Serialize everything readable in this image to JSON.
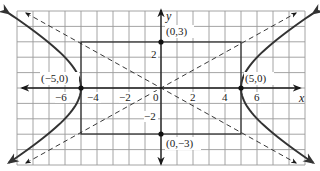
{
  "chart_data": {
    "type": "line",
    "title": "",
    "xlabel": "x",
    "ylabel": "y",
    "xlim": [
      -9,
      9
    ],
    "ylim": [
      -5,
      5
    ],
    "grid": true,
    "x_ticks": [
      -6,
      -4,
      -2,
      0,
      2,
      4,
      6
    ],
    "y_ticks": [
      -2,
      2
    ],
    "x_tick_labels": [
      "−6",
      "−4",
      "−2",
      "0",
      "2",
      "4",
      "6"
    ],
    "y_tick_labels": [
      "−2",
      "2"
    ],
    "series": [
      {
        "name": "hyperbola-right-branch",
        "style": "solid",
        "equation": "x^2/25 - y^2/9 = 1, x>0"
      },
      {
        "name": "hyperbola-left-branch",
        "style": "solid",
        "equation": "x^2/25 - y^2/9 = 1, x<0"
      },
      {
        "name": "asymptote-positive",
        "style": "dashed",
        "equation": "y = 3x/5"
      },
      {
        "name": "asymptote-negative",
        "style": "dashed",
        "equation": "y = -3x/5"
      },
      {
        "name": "central-rectangle",
        "style": "solid",
        "corners": [
          [
            -5,
            -3
          ],
          [
            5,
            -3
          ],
          [
            5,
            3
          ],
          [
            -5,
            3
          ]
        ]
      }
    ],
    "points": [
      {
        "label": "(−5,0)",
        "x": -5,
        "y": 0
      },
      {
        "label": "(5,0)",
        "x": 5,
        "y": 0
      },
      {
        "label": "(0,3)",
        "x": 0,
        "y": 3
      },
      {
        "label": "(0,−3)",
        "x": 0,
        "y": -3
      }
    ],
    "annotations": [
      "(−5,0)",
      "(5,0)",
      "(0,3)",
      "(0,−3)"
    ]
  },
  "labels": {
    "x_axis": "x",
    "y_axis": "y",
    "vertex_left": "(−5,0)",
    "vertex_right": "(5,0)",
    "covertex_top": "(0,3)",
    "covertex_bottom": "(0,−3)",
    "tick_x_m6": "−6",
    "tick_x_m4": "−4",
    "tick_x_m2": "−2",
    "tick_origin": "0",
    "tick_x_2": "2",
    "tick_x_4": "4",
    "tick_x_6": "6",
    "tick_y_2": "2",
    "tick_y_m2": "−2"
  }
}
